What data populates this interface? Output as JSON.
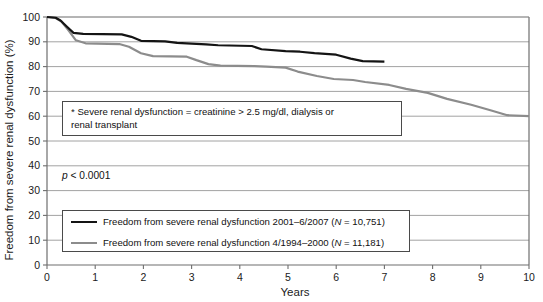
{
  "chart_data": {
    "type": "line",
    "title": "",
    "xlabel": "Years",
    "ylabel": "Freedom from severe renal dysfunction (%)",
    "xlim": [
      0,
      10
    ],
    "ylim": [
      0,
      100
    ],
    "xticks": [
      "0",
      "1",
      "2",
      "3",
      "4",
      "5",
      "6",
      "7",
      "8",
      "9",
      "10"
    ],
    "yticks": [
      "0",
      "10",
      "20",
      "30",
      "40",
      "50",
      "60",
      "70",
      "80",
      "90",
      "100"
    ],
    "grid": "horizontal",
    "legend_position": "lower-left-inside",
    "series": [
      {
        "name": "Freedom from severe renal dysfunction 2001–6/2007 (N = 10,751)",
        "color": "#141414",
        "width": 2.2,
        "x": [
          0.0,
          0.18,
          0.28,
          0.42,
          0.55,
          0.75,
          1.55,
          1.75,
          1.95,
          2.45,
          2.7,
          3.3,
          3.55,
          4.25,
          4.45,
          4.95,
          5.25,
          5.55,
          6.0,
          6.3,
          6.55,
          7.0
        ],
        "y": [
          100.0,
          99.7,
          98.6,
          96.0,
          93.6,
          93.2,
          93.0,
          92.0,
          90.4,
          90.2,
          89.6,
          89.0,
          88.6,
          88.3,
          87.0,
          86.2,
          86.0,
          85.4,
          84.8,
          83.2,
          82.2,
          82.0
        ]
      },
      {
        "name": "Freedom from severe renal dysfunction 4/1994–2000 (N = 11,181)",
        "color": "#8c8c8c",
        "width": 2.2,
        "x": [
          0.0,
          0.18,
          0.3,
          0.45,
          0.6,
          0.8,
          1.5,
          1.7,
          1.95,
          2.2,
          2.9,
          3.1,
          3.35,
          3.6,
          4.3,
          4.55,
          4.95,
          5.2,
          5.6,
          5.95,
          6.35,
          6.6,
          7.1,
          7.45,
          7.9,
          8.3,
          8.8,
          9.2,
          9.55,
          10.0
        ],
        "y": [
          100.0,
          99.6,
          98.2,
          94.5,
          90.6,
          89.4,
          89.1,
          88.0,
          85.4,
          84.2,
          84.0,
          82.6,
          81.0,
          80.4,
          80.2,
          80.0,
          79.6,
          78.0,
          76.2,
          75.0,
          74.6,
          73.8,
          72.6,
          71.0,
          69.4,
          67.0,
          64.6,
          62.4,
          60.4,
          60.0
        ]
      }
    ],
    "annotations": [
      {
        "name": "footnote-definition",
        "line1": "* Severe renal dysfunction = creatinine > 2.5 mg/dl, dialysis or",
        "line2": "renal transplant"
      },
      {
        "name": "p-value",
        "italic_prefix": "p",
        "rest": " < 0.0001"
      }
    ]
  },
  "legend": {
    "items": [
      {
        "label": "Freedom from severe renal dysfunction 2001–6/2007 (",
        "italic": "N",
        "tail": " = 10,751)",
        "color": "#141414"
      },
      {
        "label": "Freedom from severe renal dysfunction 4/1994–2000 (",
        "italic": "N",
        "tail": " = 11,181)",
        "color": "#8c8c8c"
      }
    ]
  }
}
